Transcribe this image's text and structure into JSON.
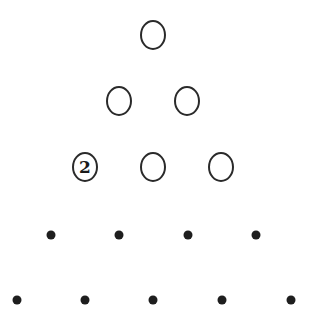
{
  "diagram": {
    "type": "number-triangle",
    "rows": [
      {
        "y": 35,
        "kind": "circle",
        "cells": [
          {
            "x": 153,
            "label": ""
          }
        ]
      },
      {
        "y": 101,
        "kind": "circle",
        "cells": [
          {
            "x": 119,
            "label": ""
          },
          {
            "x": 187,
            "label": ""
          }
        ]
      },
      {
        "y": 167,
        "kind": "circle",
        "cells": [
          {
            "x": 85,
            "label": "2"
          },
          {
            "x": 153,
            "label": ""
          },
          {
            "x": 221,
            "label": ""
          }
        ]
      },
      {
        "y": 235,
        "kind": "dot",
        "cells": [
          {
            "x": 51
          },
          {
            "x": 119
          },
          {
            "x": 188
          },
          {
            "x": 256
          }
        ]
      },
      {
        "y": 300,
        "kind": "dot",
        "cells": [
          {
            "x": 17
          },
          {
            "x": 85
          },
          {
            "x": 153
          },
          {
            "x": 222
          },
          {
            "x": 291
          }
        ]
      }
    ],
    "colors": {
      "stroke": "#2a2a2a",
      "dot": "#1e1e1e",
      "background": "#ffffff"
    }
  }
}
